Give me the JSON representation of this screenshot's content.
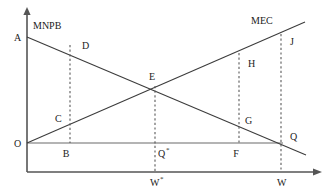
{
  "figure": {
    "kind": "economics-externality-diagram",
    "background_color": "#ffffff",
    "line_color": "#3c3c3c",
    "axis_color": "#555555",
    "dash_color": "#5a5a5a",
    "text_color": "#1b1b1b"
  },
  "curves": {
    "mnpb": {
      "label": "MNPB",
      "label_x": 33,
      "label_y": 29,
      "x1": 27,
      "y1": 37,
      "x2": 306,
      "y2": 155
    },
    "mec": {
      "label": "MEC",
      "label_x": 251,
      "label_y": 24,
      "x1": 27,
      "y1": 143,
      "x2": 305,
      "y2": 22
    }
  },
  "axes": {
    "vertical": {
      "x": 27,
      "y_top": 10,
      "y_bottom": 172
    },
    "vertical_arrow_tip_y": 7,
    "horizontal_inner": {
      "y": 143,
      "x_start": 27,
      "x_end": 283
    },
    "horizontal_bottom": {
      "y": 172,
      "x_start": 27,
      "x_end": 318
    },
    "horizontal_arrow_tip_x": 322
  },
  "dashed_verticals": [
    {
      "name": "b-d-line",
      "x": 70,
      "y_top": 45,
      "y_bottom": 143
    },
    {
      "name": "qstar-e-line",
      "x": 155,
      "y_top": 86,
      "y_bottom": 172
    },
    {
      "name": "f-h-line",
      "x": 239,
      "y_top": 53,
      "y_bottom": 143
    },
    {
      "name": "w-j-line",
      "x": 281,
      "y_top": 34,
      "y_bottom": 172
    }
  ],
  "points": [
    {
      "id": "A",
      "label": "A",
      "label_x": 14,
      "label_y": 41,
      "anchor": "start"
    },
    {
      "id": "O",
      "label": "O",
      "label_x": 14,
      "label_y": 147,
      "anchor": "start"
    },
    {
      "id": "MNPB_label",
      "label": "MNPB",
      "label_x": 33,
      "label_y": 29,
      "anchor": "start"
    },
    {
      "id": "D",
      "label": "D",
      "label_x": 82,
      "label_y": 49,
      "anchor": "start"
    },
    {
      "id": "C",
      "label": "C",
      "label_x": 55,
      "label_y": 122,
      "anchor": "start"
    },
    {
      "id": "B",
      "label": "B",
      "label_x": 66,
      "label_y": 157,
      "anchor": "middle"
    },
    {
      "id": "E",
      "label": "E",
      "label_x": 152,
      "label_y": 80,
      "anchor": "middle"
    },
    {
      "id": "H",
      "label": "H",
      "label_x": 248,
      "label_y": 67,
      "anchor": "start"
    },
    {
      "id": "G",
      "label": "G",
      "label_x": 245,
      "label_y": 124,
      "anchor": "start"
    },
    {
      "id": "F",
      "label": "F",
      "label_x": 236,
      "label_y": 157,
      "anchor": "middle"
    },
    {
      "id": "J",
      "label": "J",
      "label_x": 290,
      "label_y": 45,
      "anchor": "start"
    },
    {
      "id": "Q",
      "label": "Q",
      "label_x": 290,
      "label_y": 140,
      "anchor": "start"
    },
    {
      "id": "MEC_label",
      "label": "MEC",
      "label_x": 251,
      "label_y": 24,
      "anchor": "start"
    }
  ],
  "starred_points": [
    {
      "id": "Qstar",
      "base": "Q",
      "star": "*",
      "base_x": 158,
      "base_y": 157,
      "star_x": 166,
      "star_y": 152
    },
    {
      "id": "Wstar",
      "base": "W",
      "star": "*",
      "base_x": 150,
      "base_y": 186,
      "star_x": 160,
      "star_y": 181
    }
  ],
  "axis_ticks": [
    {
      "id": "W",
      "label": "W",
      "label_x": 277,
      "label_y": 186,
      "anchor": "start"
    }
  ]
}
